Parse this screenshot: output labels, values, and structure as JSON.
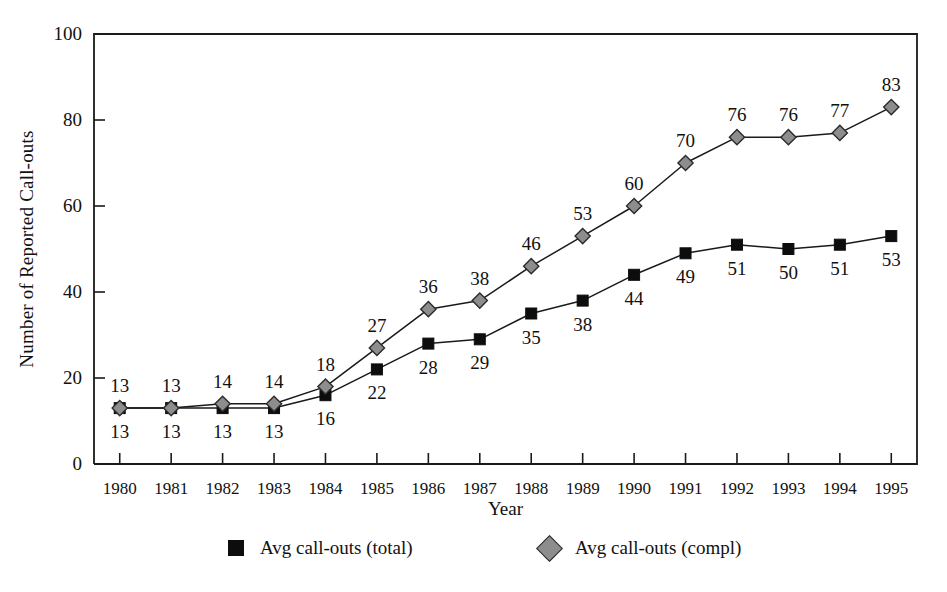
{
  "chart_data": {
    "type": "line",
    "title": "",
    "xlabel": "Year",
    "ylabel": "Number of Reported Call-outs",
    "categories": [
      "1980",
      "1981",
      "1982",
      "1983",
      "1984",
      "1985",
      "1986",
      "1987",
      "1988",
      "1989",
      "1990",
      "1991",
      "1992",
      "1993",
      "1994",
      "1995"
    ],
    "x": [
      1980,
      1981,
      1982,
      1983,
      1984,
      1985,
      1986,
      1987,
      1988,
      1989,
      1990,
      1991,
      1992,
      1993,
      1994,
      1995
    ],
    "ylim": [
      0,
      100
    ],
    "yticks": [
      0,
      20,
      40,
      60,
      80,
      100
    ],
    "ytick_labels": [
      "0",
      "20",
      "40",
      "60",
      "80",
      "100"
    ],
    "grid": false,
    "legend_position": "bottom",
    "series": [
      {
        "name": "Avg call-outs (total)",
        "marker": "square",
        "color": "#0d0d0d",
        "label_position": "below",
        "values": [
          13,
          13,
          13,
          13,
          16,
          22,
          28,
          29,
          35,
          38,
          44,
          49,
          51,
          50,
          51,
          53
        ],
        "value_labels": [
          "13",
          "13",
          "13",
          "13",
          "16",
          "22",
          "28",
          "29",
          "35",
          "38",
          "44",
          "49",
          "51",
          "50",
          "51",
          "53"
        ]
      },
      {
        "name": "Avg call-outs (compl)",
        "marker": "diamond",
        "color": "#8d8d8d",
        "label_position": "above",
        "values": [
          13,
          13,
          14,
          14,
          18,
          27,
          36,
          38,
          46,
          53,
          60,
          70,
          76,
          76,
          77,
          83
        ],
        "value_labels": [
          "13",
          "13",
          "14",
          "14",
          "18",
          "27",
          "36",
          "38",
          "46",
          "53",
          "60",
          "70",
          "76",
          "76",
          "77",
          "83"
        ]
      }
    ]
  },
  "legend": {
    "entries": [
      {
        "label": "Avg call-outs (total)",
        "marker": "square-marker-icon"
      },
      {
        "label": "Avg call-outs (compl)",
        "marker": "diamond-marker-icon"
      }
    ]
  },
  "axes": {
    "x_title": "Year",
    "y_title": "Number of Reported Call-outs"
  }
}
